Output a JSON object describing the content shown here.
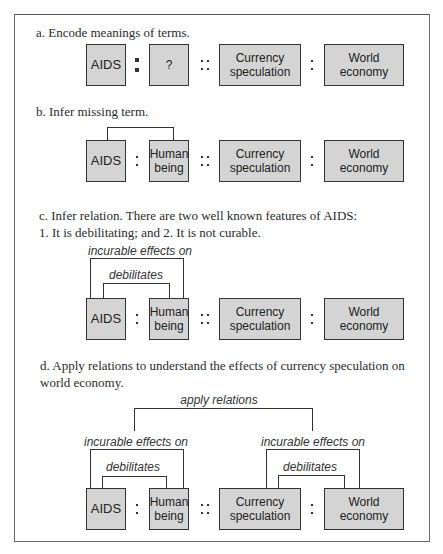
{
  "sections": {
    "a": {
      "caption": "a. Encode meanings of terms.",
      "terms": [
        "AIDS",
        "?",
        "Currency\nspeculation",
        "World\neconomy"
      ],
      "terms_lines": [
        [
          "AIDS"
        ],
        [
          "?"
        ],
        [
          "Currency",
          "speculation"
        ],
        [
          "World",
          "economy"
        ]
      ]
    },
    "b": {
      "caption": "b. Infer missing term.",
      "terms_lines": [
        [
          "AIDS"
        ],
        [
          "Human",
          "being"
        ],
        [
          "Currency",
          "speculation"
        ],
        [
          "World",
          "economy"
        ]
      ]
    },
    "c": {
      "caption_line1": "c. Infer relation. There are two well known features of AIDS:",
      "caption_line2": "1. It is debilitating; and 2. It is not curable.",
      "relations": {
        "outer": "incurable effects on",
        "inner": "debilitates"
      },
      "terms_lines": [
        [
          "AIDS"
        ],
        [
          "Human",
          "being"
        ],
        [
          "Currency",
          "speculation"
        ],
        [
          "World",
          "economy"
        ]
      ]
    },
    "d": {
      "caption_line1": "d. Apply relations to understand the effects of currency speculation on",
      "caption_line2": "world economy.",
      "top_relation": "apply relations",
      "left_relations": {
        "outer": "incurable effects on",
        "inner": "debilitates"
      },
      "right_relations": {
        "outer": "incurable effects on",
        "inner": "debilitates"
      },
      "terms_lines": [
        [
          "AIDS"
        ],
        [
          "Human",
          "being"
        ],
        [
          "Currency",
          "speculation"
        ],
        [
          "World",
          "economy"
        ]
      ]
    }
  },
  "colors": {
    "box_fill": "#d4d4d4",
    "box_border": "#333333",
    "frame_border": "#6a6a6a"
  }
}
